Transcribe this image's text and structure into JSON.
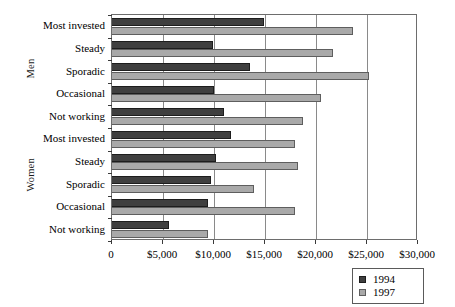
{
  "chart_data": {
    "type": "bar",
    "orientation": "horizontal",
    "title": "",
    "xlabel": "",
    "ylabel": "",
    "xlim": [
      0,
      30000
    ],
    "xticks": [
      0,
      5000,
      10000,
      15000,
      20000,
      25000,
      30000
    ],
    "xticklabels": [
      "0",
      "$5,000",
      "$10,000",
      "$15,000",
      "$20,000",
      "$25,000",
      "$30,000"
    ],
    "grid": true,
    "grid_axis": "x",
    "legend_position": "bottom-right",
    "groups": [
      {
        "name": "Men",
        "categories": [
          "Most invested",
          "Steady",
          "Sporadic",
          "Occasional",
          "Not working"
        ]
      },
      {
        "name": "Women",
        "categories": [
          "Most invested",
          "Steady",
          "Sporadic",
          "Occasional",
          "Not working"
        ]
      }
    ],
    "categories": [
      "Most invested",
      "Steady",
      "Sporadic",
      "Occasional",
      "Not working",
      "Most invested",
      "Steady",
      "Sporadic",
      "Occasional",
      "Not working"
    ],
    "series": [
      {
        "name": "1994",
        "color": "#3f3f3f",
        "values": [
          14950,
          9900,
          13500,
          10000,
          11000,
          11700,
          10200,
          9700,
          9400,
          5600
        ]
      },
      {
        "name": "1997",
        "color": "#a9a9a9",
        "values": [
          23600,
          21700,
          25200,
          20500,
          18700,
          17900,
          18200,
          13900,
          17900,
          9400
        ]
      }
    ]
  },
  "legend": {
    "entries": [
      {
        "label": "1994",
        "swatch": "dark-square-swatch"
      },
      {
        "label": "1997",
        "swatch": "light-square-swatch"
      }
    ]
  },
  "axis": {
    "x_tick_labels": [
      "0",
      "$5,000",
      "$10,000",
      "$15,000",
      "$20,000",
      "$25,000",
      "$30,000"
    ],
    "group_labels": [
      "Men",
      "Women"
    ],
    "category_labels": [
      "Most invested",
      "Steady",
      "Sporadic",
      "Occasional",
      "Not working",
      "Most invested",
      "Steady",
      "Sporadic",
      "Occasional",
      "Not working"
    ]
  }
}
